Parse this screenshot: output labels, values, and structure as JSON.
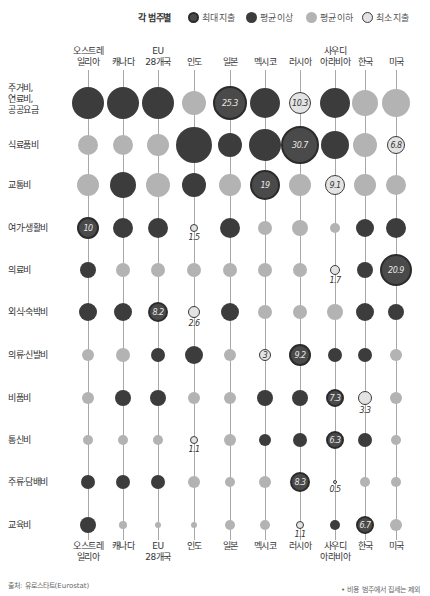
{
  "legend": {
    "title": "각 범주별",
    "items": [
      {
        "key": "M",
        "label": "최대 지출"
      },
      {
        "key": "A",
        "label": "평균 이상"
      },
      {
        "key": "B",
        "label": "평균 이하"
      },
      {
        "key": "m",
        "label": "최소 지출"
      }
    ]
  },
  "colors": {
    "max_fill": "#4a4a4a",
    "max_border": "#2b2b2b",
    "above_avg": "#3c3c3c",
    "below_avg": "#b3b3b3",
    "min_fill": "#e3e3e3",
    "line": "#a8a8a8"
  },
  "footer": {
    "source": "출처: 유로스타트(Eurostat)",
    "note": "• 비용 범주에서 집세는 제외"
  },
  "chart_data": {
    "type": "bubble-matrix",
    "title": "",
    "legend_title": "각 범주별",
    "legend": [
      "최대 지출",
      "평균 이상",
      "평균 이하",
      "최소 지출"
    ],
    "countries": [
      "오스트레\n일리아",
      "캐나다",
      "EU\n28개국",
      "인도",
      "일본",
      "멕시코",
      "러시아",
      "사우디\n아라비아",
      "한국",
      "미국"
    ],
    "categories": [
      "주거비,\n연료비,\n공공요금",
      "식료품비",
      "교통비",
      "여가·생활비",
      "의료비",
      "외식·숙박비",
      "의류·신발비",
      "비품비",
      "통신비",
      "주류·담배비",
      "교육비"
    ],
    "status_key": {
      "M": "최대 지출",
      "A": "평균 이상",
      "B": "평균 이하",
      "m": "최소 지출"
    },
    "rows": [
      {
        "category": "주거비, 연료비, 공공요금",
        "status": [
          "A",
          "A",
          "A",
          "B",
          "M",
          "A",
          "m",
          "A",
          "B",
          "B"
        ],
        "labels": {
          "일본": 25.3,
          "러시아": 10.3
        }
      },
      {
        "category": "식료품비",
        "status": [
          "B",
          "B",
          "B",
          "A",
          "A",
          "A",
          "M",
          "A",
          "B",
          "m"
        ],
        "labels": {
          "러시아": 30.7,
          "미국": 6.8
        }
      },
      {
        "category": "교통비",
        "status": [
          "B",
          "A",
          "B",
          "A",
          "B",
          "M",
          "B",
          "m",
          "B",
          "B"
        ],
        "labels": {
          "멕시코": 19,
          "사우디아라비아": 9.1
        }
      },
      {
        "category": "여가·생활비",
        "status": [
          "M",
          "A",
          "A",
          "m",
          "A",
          "B",
          "B",
          "B",
          "A",
          "A"
        ],
        "labels": {
          "오스트레일리아": 10,
          "인도": 1.5
        }
      },
      {
        "category": "의료비",
        "status": [
          "A",
          "B",
          "B",
          "B",
          "B",
          "B",
          "B",
          "m",
          "A",
          "M"
        ],
        "labels": {
          "사우디아라비아": 1.7,
          "미국": 20.9
        }
      },
      {
        "category": "외식·숙박비",
        "status": [
          "A",
          "A",
          "M",
          "m",
          "A",
          "B",
          "B",
          "B",
          "A",
          "A"
        ],
        "labels": {
          "EU 28개국": 8.2,
          "인도": 2.6
        }
      },
      {
        "category": "의류·신발비",
        "status": [
          "B",
          "B",
          "A",
          "A",
          "B",
          "m",
          "M",
          "A",
          "A",
          "B"
        ],
        "labels": {
          "멕시코": 3,
          "러시아": 9.2
        }
      },
      {
        "category": "비품비",
        "status": [
          "B",
          "A",
          "A",
          "B",
          "B",
          "A",
          "A",
          "M",
          "m",
          "B"
        ],
        "labels": {
          "사우디아라비아": 7.3,
          "한국": 3.3
        }
      },
      {
        "category": "통신비",
        "status": [
          "B",
          "B",
          "B",
          "m",
          "B",
          "A",
          "A",
          "M",
          "A",
          "B"
        ],
        "labels": {
          "인도": 1.1,
          "사우디아라비아": 6.3
        }
      },
      {
        "category": "주류·담배비",
        "status": [
          "A",
          "A",
          "A",
          "B",
          "B",
          "B",
          "M",
          "m",
          "B",
          "B"
        ],
        "labels": {
          "러시아": 8.3,
          "사우디아라비아": 0.5
        }
      },
      {
        "category": "교육비",
        "status": [
          "A",
          "B",
          "B",
          "B",
          "B",
          "B",
          "m",
          "A",
          "M",
          "B"
        ],
        "labels": {
          "러시아": 1.1,
          "한국": 6.7
        }
      }
    ],
    "unit": "%"
  },
  "layout": {
    "cols_x": [
      88,
      123,
      158,
      194,
      230,
      265,
      300,
      335,
      365,
      396
    ],
    "rows_y": [
      103,
      145,
      185,
      228,
      270,
      312,
      355,
      398,
      440,
      482,
      525
    ],
    "row_label_y": [
      83,
      140,
      180,
      223,
      265,
      307,
      350,
      393,
      435,
      477,
      520
    ],
    "radii": [
      [
        16,
        16,
        16,
        12,
        17,
        15,
        11,
        15,
        13,
        14
      ],
      [
        10,
        10,
        11,
        18,
        12,
        16,
        19,
        14,
        12,
        9
      ],
      [
        11,
        13,
        12,
        12,
        11,
        15,
        11,
        10,
        11,
        10
      ],
      [
        11,
        10,
        10,
        4,
        10,
        7,
        8,
        5,
        9,
        10
      ],
      [
        8,
        7,
        7,
        7,
        7,
        7,
        7,
        5,
        8,
        16
      ],
      [
        9,
        9,
        10,
        6,
        9,
        7,
        7,
        8,
        9,
        8
      ],
      [
        6,
        7,
        7,
        9,
        6,
        6,
        11,
        7,
        7,
        6
      ],
      [
        6,
        8,
        8,
        6,
        6,
        8,
        8,
        9,
        7,
        6
      ],
      [
        5,
        5,
        5,
        4,
        6,
        6,
        7,
        9,
        7,
        5
      ],
      [
        7,
        7,
        7,
        6,
        5,
        6,
        10,
        2,
        5,
        5
      ],
      [
        8,
        4,
        3,
        3,
        5,
        5,
        4,
        5,
        9,
        6
      ]
    ],
    "values": [
      [
        null,
        null,
        null,
        null,
        "25.3",
        null,
        "10.3",
        null,
        null,
        null
      ],
      [
        null,
        null,
        null,
        null,
        null,
        null,
        "30.7",
        null,
        null,
        "6.8"
      ],
      [
        null,
        null,
        null,
        null,
        null,
        "19",
        null,
        "9.1",
        null,
        null
      ],
      [
        "10",
        null,
        null,
        "1.5",
        null,
        null,
        null,
        null,
        null,
        null
      ],
      [
        null,
        null,
        null,
        null,
        null,
        null,
        null,
        "1.7",
        null,
        "20.9"
      ],
      [
        null,
        null,
        "8.2",
        "2.6",
        null,
        null,
        null,
        null,
        null,
        null
      ],
      [
        null,
        null,
        null,
        null,
        null,
        "3",
        "9.2",
        null,
        null,
        null
      ],
      [
        null,
        null,
        null,
        null,
        null,
        null,
        null,
        "7.3",
        "3.3",
        null
      ],
      [
        null,
        null,
        null,
        "1.1",
        null,
        null,
        null,
        "6.3",
        null,
        null
      ],
      [
        null,
        null,
        null,
        null,
        null,
        null,
        "8.3",
        "0.5",
        null,
        null
      ],
      [
        null,
        null,
        null,
        null,
        null,
        null,
        "1.1",
        null,
        "6.7",
        null
      ]
    ],
    "below_label": [
      [
        false,
        false,
        false,
        false,
        false,
        false,
        false,
        false,
        false,
        false
      ],
      [
        false,
        false,
        false,
        false,
        false,
        false,
        false,
        false,
        false,
        false
      ],
      [
        false,
        false,
        false,
        false,
        false,
        false,
        false,
        false,
        false,
        false
      ],
      [
        false,
        false,
        false,
        true,
        false,
        false,
        false,
        false,
        false,
        false
      ],
      [
        false,
        false,
        false,
        false,
        false,
        false,
        false,
        true,
        false,
        false
      ],
      [
        false,
        false,
        false,
        true,
        false,
        false,
        false,
        false,
        false,
        false
      ],
      [
        false,
        false,
        false,
        false,
        false,
        false,
        false,
        false,
        false,
        false
      ],
      [
        false,
        false,
        false,
        false,
        false,
        false,
        false,
        false,
        true,
        false
      ],
      [
        false,
        false,
        false,
        true,
        false,
        false,
        false,
        false,
        false,
        false
      ],
      [
        false,
        false,
        false,
        false,
        false,
        false,
        false,
        true,
        false,
        false
      ],
      [
        false,
        false,
        false,
        false,
        false,
        false,
        true,
        false,
        false,
        false
      ]
    ]
  }
}
